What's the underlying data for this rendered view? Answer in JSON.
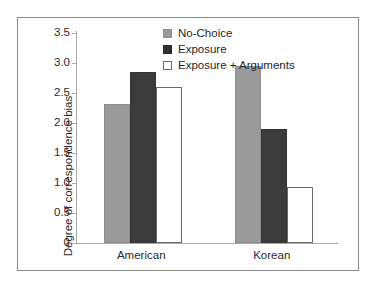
{
  "chart_data": {
    "type": "bar",
    "title": "",
    "xlabel": "",
    "ylabel": "Degree of correspondence bias",
    "categories": [
      "American",
      "Korean"
    ],
    "series": [
      {
        "name": "No-Choice",
        "values": [
          2.31,
          2.95
        ],
        "color": "#9a9a9a"
      },
      {
        "name": "Exposure",
        "values": [
          2.85,
          1.9
        ],
        "color": "#3b3b3b"
      },
      {
        "name": "Exposure + Arguments",
        "values": [
          2.6,
          0.93
        ],
        "color": "#ffffff"
      }
    ],
    "ylim": [
      0,
      3.5
    ],
    "ytick_values": [
      0,
      0.5,
      1.0,
      1.5,
      2.0,
      2.5,
      3.0,
      3.5
    ],
    "ytick_labels": [
      "0",
      "0.5",
      "1.0",
      "1.5",
      "2.0",
      "2.5",
      "3.0",
      "3.5"
    ],
    "grid": false,
    "legend_position": "top-center",
    "frame_color": "#8c8c8c",
    "axis_color": "#a9a9a9",
    "background": "#ffffff"
  }
}
